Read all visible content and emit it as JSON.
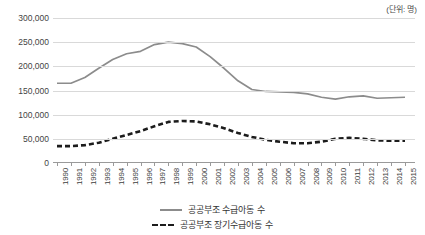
{
  "unit_note": "(단위: 명)",
  "legend": {
    "position": "bottom-center",
    "items": [
      {
        "label": "공공부조 수급아동 수",
        "style": "solid",
        "color": "#8c8c8c"
      },
      {
        "label": "공공부조 장기수급아동 수",
        "style": "dashed",
        "color": "#1c1c1c"
      }
    ]
  },
  "chart_data": {
    "type": "line",
    "title": "",
    "subtitle": "",
    "xlabel": "",
    "ylabel": "",
    "annotations": [
      "(단위: 명)"
    ],
    "grid": true,
    "legend_position": "bottom-center",
    "ylim": [
      0,
      300000
    ],
    "ytick_labels": [
      "300,000",
      "250,000",
      "200,000",
      "150,000",
      "100,000",
      "50,000",
      "0"
    ],
    "yticks": [
      300000,
      250000,
      200000,
      150000,
      100000,
      50000,
      0
    ],
    "categories": [
      "1990",
      "1991",
      "1992",
      "1993",
      "1994",
      "1995",
      "1996",
      "1997",
      "1998",
      "1999",
      "2000",
      "2001",
      "2002",
      "2003",
      "2004",
      "2005",
      "2006",
      "2007",
      "2008",
      "2009",
      "2010",
      "2011",
      "2012",
      "2013",
      "2014",
      "2015"
    ],
    "series": [
      {
        "name": "공공부조 수급아동 수",
        "style": "solid",
        "color": "#8c8c8c",
        "values": [
          165000,
          165000,
          177000,
          196000,
          214000,
          226000,
          231000,
          245000,
          250000,
          247000,
          240000,
          220000,
          196000,
          170000,
          152000,
          148000,
          147000,
          146000,
          143000,
          136000,
          132000,
          137000,
          139000,
          134000,
          135000,
          136000
        ]
      },
      {
        "name": "공공부조 장기수급아동 수",
        "style": "dashed",
        "color": "#1c1c1c",
        "values": [
          35000,
          35000,
          37000,
          42000,
          50000,
          58000,
          66000,
          76000,
          85000,
          87000,
          86000,
          80000,
          72000,
          62000,
          54000,
          48000,
          44000,
          41000,
          41000,
          44000,
          50000,
          52000,
          50000,
          47000,
          46000,
          46000
        ]
      }
    ]
  }
}
